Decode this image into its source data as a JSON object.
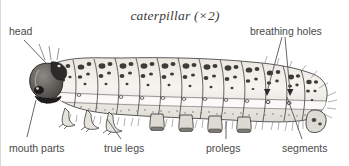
{
  "figure": {
    "title": "caterpillar (×2)",
    "subject": "caterpillar",
    "magnification": "×2",
    "line_color": "#555555",
    "text_color": "#4a4a4a",
    "background": "#ffffff",
    "ink_color": "#3a3a3a",
    "body_fill": "#f2f0ec"
  },
  "labels": {
    "head": "head",
    "mouth_parts": "mouth parts",
    "true_legs": "true legs",
    "prolegs": "prolegs",
    "segments": "segments",
    "breathing_holes": "breathing holes"
  }
}
